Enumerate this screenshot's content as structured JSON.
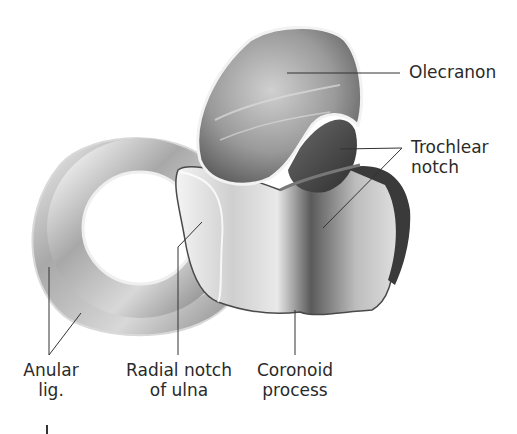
{
  "figure": {
    "colors": {
      "background": "#ffffff",
      "bone_light": "#e8e8e8",
      "bone_mid": "#b5b5b5",
      "bone_dark": "#5a5a5a",
      "leader_line": "#333333",
      "label_text": "#2a2a2a"
    }
  },
  "labels": {
    "olecranon": {
      "lines": [
        "Olecranon"
      ]
    },
    "trochlear_notch": {
      "lines": [
        "Trochlear",
        "notch"
      ]
    },
    "anular_lig": {
      "lines": [
        "Anular",
        "lig."
      ]
    },
    "radial_notch": {
      "lines": [
        "Radial notch",
        "of ulna"
      ]
    },
    "coronoid_process": {
      "lines": [
        "Coronoid",
        "process"
      ]
    }
  }
}
